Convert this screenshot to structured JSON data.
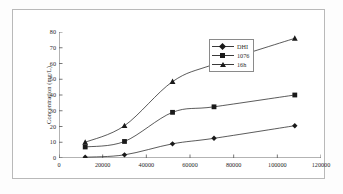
{
  "chart_data": {
    "type": "line",
    "title": "",
    "subtitle": "",
    "xlabel": "",
    "ylabel": "Concentration (mg/L)",
    "xlim": [
      0,
      120000
    ],
    "ylim": [
      0,
      80
    ],
    "xticks": [
      0,
      20000,
      40000,
      60000,
      80000,
      100000,
      120000
    ],
    "xticklabels": [
      "0",
      "20000",
      "40000",
      "60000",
      "80000",
      "100000",
      "120000"
    ],
    "yticks": [
      0,
      10,
      20,
      30,
      40,
      50,
      60,
      70,
      80
    ],
    "yticklabels": [
      "0",
      "10",
      "20",
      "30",
      "40",
      "50",
      "60",
      "70",
      "80"
    ],
    "grid": false,
    "legend_position": "right",
    "x": [
      12000,
      30000,
      52000,
      71000,
      108000
    ],
    "series": [
      {
        "name": "DHI",
        "marker": "diamond",
        "color": "#1a1a1a",
        "values": [
          0.5,
          2.0,
          9.0,
          12.5,
          20.5
        ]
      },
      {
        "name": "1076",
        "marker": "square",
        "color": "#1a1a1a",
        "values": [
          7.0,
          10.5,
          29.0,
          32.5,
          40.0
        ]
      },
      {
        "name": "16h",
        "marker": "triangle",
        "color": "#1a1a1a",
        "values": [
          10.0,
          20.5,
          48.5,
          59.5,
          76.0
        ]
      }
    ]
  }
}
